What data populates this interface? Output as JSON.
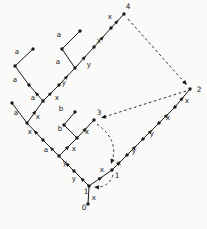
{
  "figure": {
    "background": "#fafaf8",
    "ink": "#1a1a1a",
    "width": 207,
    "height": 229,
    "node_labels": [
      {
        "text": "0",
        "x": 84,
        "y": 207
      },
      {
        "text": "1",
        "x": 86,
        "y": 191
      },
      {
        "text": "1",
        "x": 117,
        "y": 175
      },
      {
        "text": "2",
        "x": 199,
        "y": 89
      },
      {
        "text": "3",
        "x": 99,
        "y": 112
      },
      {
        "text": "4",
        "x": 128,
        "y": 6
      }
    ],
    "nodes": [
      {
        "x": 88,
        "y": 204
      },
      {
        "x": 89,
        "y": 186
      },
      {
        "x": 74,
        "y": 171
      },
      {
        "x": 59,
        "y": 156
      },
      {
        "x": 43,
        "y": 140
      },
      {
        "x": 27,
        "y": 123
      },
      {
        "x": 12,
        "y": 103
      },
      {
        "x": 43,
        "y": 101
      },
      {
        "x": 29,
        "y": 85
      },
      {
        "x": 15,
        "y": 66
      },
      {
        "x": 33,
        "y": 49
      },
      {
        "x": 59,
        "y": 85
      },
      {
        "x": 75,
        "y": 68
      },
      {
        "x": 62,
        "y": 49
      },
      {
        "x": 80,
        "y": 31
      },
      {
        "x": 94,
        "y": 47
      },
      {
        "x": 111,
        "y": 28
      },
      {
        "x": 124,
        "y": 14
      },
      {
        "x": 77,
        "y": 138
      },
      {
        "x": 64,
        "y": 125
      },
      {
        "x": 75,
        "y": 112
      },
      {
        "x": 94,
        "y": 120
      },
      {
        "x": 112,
        "y": 170
      },
      {
        "x": 127,
        "y": 155
      },
      {
        "x": 143,
        "y": 139
      },
      {
        "x": 159,
        "y": 123
      },
      {
        "x": 175,
        "y": 107
      },
      {
        "x": 190,
        "y": 89
      }
    ],
    "tree_edges": [
      {
        "x1": 88,
        "y1": 204,
        "x2": 89,
        "y2": 187,
        "label": "x",
        "lx": 94,
        "ly": 197,
        "arrow": false
      },
      {
        "x1": 89,
        "y1": 186,
        "x2": 74,
        "y2": 171,
        "label": "y",
        "lx": 74,
        "ly": 178,
        "arrow": true
      },
      {
        "x1": 74,
        "y1": 171,
        "x2": 59,
        "y2": 156,
        "label": "y",
        "lx": 65,
        "ly": 162,
        "arrow": true
      },
      {
        "x1": 59,
        "y1": 156,
        "x2": 43,
        "y2": 140,
        "label": "a",
        "lx": 46,
        "ly": 149,
        "arrow": true
      },
      {
        "x1": 43,
        "y1": 140,
        "x2": 27,
        "y2": 123,
        "label": "x",
        "lx": 30,
        "ly": 131,
        "arrow": true
      },
      {
        "x1": 27,
        "y1": 123,
        "x2": 12,
        "y2": 103,
        "label": "a",
        "lx": 16,
        "ly": 112,
        "arrow": false
      },
      {
        "x1": 27,
        "y1": 123,
        "x2": 43,
        "y2": 101,
        "label": "x",
        "lx": 38,
        "ly": 116,
        "arrow": true
      },
      {
        "x1": 43,
        "y1": 101,
        "x2": 29,
        "y2": 85,
        "label": "a",
        "lx": 33,
        "ly": 97,
        "arrow": true
      },
      {
        "x1": 29,
        "y1": 85,
        "x2": 15,
        "y2": 66,
        "label": "a",
        "lx": 15,
        "ly": 79,
        "arrow": false
      },
      {
        "x1": 15,
        "y1": 66,
        "x2": 33,
        "y2": 49,
        "label": "a",
        "lx": 17,
        "ly": 51,
        "arrow": false
      },
      {
        "x1": 43,
        "y1": 101,
        "x2": 59,
        "y2": 85,
        "label": "x",
        "lx": 57,
        "ly": 97,
        "arrow": true
      },
      {
        "x1": 59,
        "y1": 85,
        "x2": 75,
        "y2": 68,
        "label": "y",
        "lx": 64,
        "ly": 82,
        "arrow": true
      },
      {
        "x1": 75,
        "y1": 68,
        "x2": 62,
        "y2": 49,
        "label": "a",
        "lx": 58,
        "ly": 61,
        "arrow": false
      },
      {
        "x1": 62,
        "y1": 49,
        "x2": 80,
        "y2": 31,
        "label": "a",
        "lx": 59,
        "ly": 34,
        "arrow": false
      },
      {
        "x1": 75,
        "y1": 68,
        "x2": 94,
        "y2": 47,
        "label": "y",
        "lx": 89,
        "ly": 64,
        "arrow": true
      },
      {
        "x1": 94,
        "y1": 47,
        "x2": 111,
        "y2": 28,
        "label": "x",
        "lx": 99,
        "ly": 40,
        "arrow": true
      },
      {
        "x1": 111,
        "y1": 28,
        "x2": 124,
        "y2": 14,
        "label": "x",
        "lx": 110,
        "ly": 16,
        "arrow": true
      },
      {
        "x1": 59,
        "y1": 156,
        "x2": 77,
        "y2": 138,
        "label": "x",
        "lx": 74,
        "ly": 148,
        "arrow": true
      },
      {
        "x1": 77,
        "y1": 138,
        "x2": 64,
        "y2": 125,
        "label": "b",
        "lx": 60,
        "ly": 128,
        "arrow": false
      },
      {
        "x1": 64,
        "y1": 125,
        "x2": 75,
        "y2": 112,
        "label": "b",
        "lx": 61,
        "ly": 108,
        "arrow": false
      },
      {
        "x1": 77,
        "y1": 138,
        "x2": 94,
        "y2": 120,
        "label": "x",
        "lx": 87,
        "ly": 131,
        "arrow": true
      },
      {
        "x1": 89,
        "y1": 186,
        "x2": 112,
        "y2": 170,
        "label": "x",
        "lx": 102,
        "ly": 169,
        "arrow": true
      },
      {
        "x1": 112,
        "y1": 170,
        "x2": 127,
        "y2": 155,
        "label": "x",
        "lx": 119,
        "ly": 162,
        "arrow": true
      },
      {
        "x1": 127,
        "y1": 155,
        "x2": 143,
        "y2": 139,
        "label": "y",
        "lx": 134,
        "ly": 150,
        "arrow": true
      },
      {
        "x1": 143,
        "y1": 139,
        "x2": 159,
        "y2": 123,
        "label": "y",
        "lx": 152,
        "ly": 133,
        "arrow": true
      },
      {
        "x1": 159,
        "y1": 123,
        "x2": 175,
        "y2": 107,
        "label": "x",
        "lx": 168,
        "ly": 117,
        "arrow": true
      },
      {
        "x1": 175,
        "y1": 107,
        "x2": 190,
        "y2": 89,
        "label": "x",
        "lx": 187,
        "ly": 100,
        "arrow": true
      }
    ],
    "dashed_edges": [
      {
        "name": "fold-4-to-2",
        "path": "M128,19 L185,83",
        "ax": 187,
        "ay": 85,
        "angle": 48
      },
      {
        "name": "fold-2-to-3",
        "path": "M186,91 L104,117",
        "ax": 101,
        "ay": 118,
        "angle": 163
      },
      {
        "name": "fold-3-to-1",
        "path": "M97,124 Q119,140 112,161",
        "ax": 111,
        "ay": 164,
        "angle": 108
      },
      {
        "name": "fold-1-to-1",
        "path": "M113,175 Q109,187 97,187",
        "ax": 94,
        "ay": 187,
        "angle": 184
      }
    ]
  }
}
